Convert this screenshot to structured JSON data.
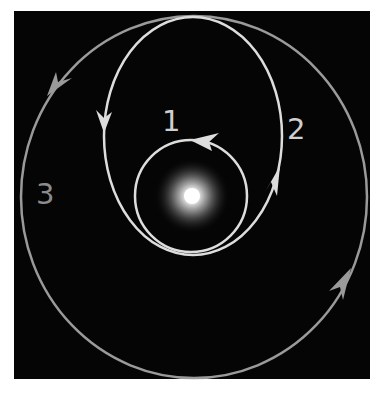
{
  "diagram": {
    "background_color": "#050505",
    "central_body": {
      "name": "star",
      "color": "#ffffff",
      "cx": 192,
      "cy": 196
    },
    "orbits": [
      {
        "id": "1",
        "label": "1",
        "type": "circular inner orbit",
        "color": "#dddddd",
        "direction": "counter-clockwise"
      },
      {
        "id": "2",
        "label": "2",
        "type": "elliptical transfer orbit",
        "color": "#dddddd",
        "direction": "counter-clockwise"
      },
      {
        "id": "3",
        "label": "3",
        "type": "circular outer orbit",
        "color": "#9a9a9a",
        "direction": "counter-clockwise"
      }
    ]
  }
}
